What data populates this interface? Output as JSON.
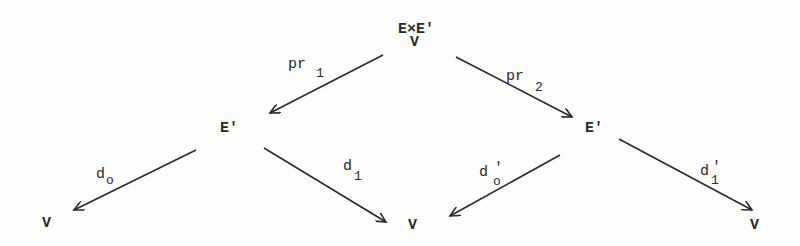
{
  "diagram": {
    "colors": {
      "ink": "#2a2a2a",
      "background": "#fdfdfc"
    },
    "nodes": {
      "top": {
        "text": "E×E'",
        "under": "V",
        "x": 398,
        "y": 33,
        "under_x": 410,
        "under_y": 46
      },
      "left_mid": {
        "text": "E'",
        "x": 220,
        "y": 132
      },
      "right_mid": {
        "text": "E'",
        "x": 585,
        "y": 132
      },
      "bottom_left": {
        "text": "V",
        "x": 42,
        "y": 227
      },
      "bottom_center": {
        "text": "V",
        "x": 408,
        "y": 229
      },
      "bottom_right": {
        "text": "V",
        "x": 750,
        "y": 229
      }
    },
    "arrows": [
      {
        "id": "pr1",
        "label": "pr",
        "sub": "1",
        "prime": "",
        "x1": 383,
        "y1": 55,
        "x2": 270,
        "y2": 113,
        "lx": 288,
        "ly": 68,
        "sx": 316,
        "sy": 77
      },
      {
        "id": "pr2",
        "label": "pr",
        "sub": "2",
        "prime": "",
        "x1": 456,
        "y1": 57,
        "x2": 572,
        "y2": 117,
        "lx": 506,
        "ly": 80,
        "sx": 535,
        "sy": 91
      },
      {
        "id": "d0",
        "label": "d",
        "sub": "o",
        "prime": "",
        "x1": 196,
        "y1": 150,
        "x2": 74,
        "y2": 210,
        "lx": 96,
        "ly": 178,
        "sx": 106,
        "sy": 184
      },
      {
        "id": "d1",
        "label": "d",
        "sub": "1",
        "prime": "",
        "x1": 264,
        "y1": 148,
        "x2": 386,
        "y2": 222,
        "lx": 343,
        "ly": 170,
        "sx": 354,
        "sy": 180
      },
      {
        "id": "d0prime",
        "label": "d",
        "sub": "o",
        "prime": "'",
        "x1": 560,
        "y1": 155,
        "x2": 450,
        "y2": 216,
        "lx": 479,
        "ly": 176,
        "sx": 493,
        "sy": 185
      },
      {
        "id": "d1prime",
        "label": "d",
        "sub": "1",
        "prime": "'",
        "x1": 619,
        "y1": 139,
        "x2": 752,
        "y2": 210,
        "lx": 700,
        "ly": 175,
        "sx": 711,
        "sy": 184
      }
    ]
  }
}
